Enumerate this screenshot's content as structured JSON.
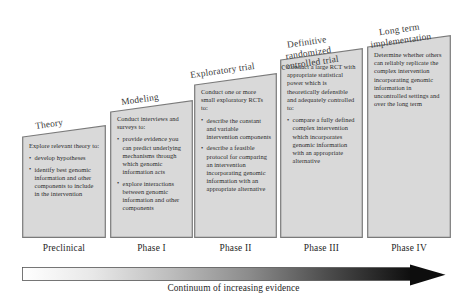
{
  "diagram": {
    "box_fill": "#d9d9d9",
    "box_stroke": "#7a7a7a",
    "arrow_start_color": "#ffffff",
    "arrow_end_color": "#0d0d0d"
  },
  "columns": [
    {
      "stage_label": "Theory",
      "phase_label": "Preclinical",
      "intro": "Explore relevant theory to:",
      "points": [
        "develop hypotheses",
        "identify best genomic information and other components to include in the intervention"
      ]
    },
    {
      "stage_label": "Modeling",
      "phase_label": "Phase I",
      "intro": "Conduct interviews and surveys to:",
      "points": [
        "provide evidence you can predict underlying mechanisms through which genomic information acts",
        "explore interactions between genomic information and other components"
      ]
    },
    {
      "stage_label": "Exploratory trial",
      "phase_label": "Phase II",
      "intro": "Conduct one or more small exploratory RCTs to:",
      "points": [
        "describe the constant and variable intervention components",
        "describe a feasible protocol for comparing an intervention incorporating genomic information with an appropriate alternative"
      ]
    },
    {
      "stage_label": "Definitive randomized controlled trial",
      "phase_label": "Phase III",
      "intro": "Conduct a large RCT with appropriate statistical power which is theoretically defensible and adequately controlled to:",
      "points": [
        "compare a fully defined complex intervention which incorporates genomic information with an appropriate alternative"
      ]
    },
    {
      "stage_label": "Long term implementation",
      "phase_label": "Phase IV",
      "intro": "Determine whether others can reliably replicate the complex intervention incorporating genomic information in uncontrolled settings and over the long term",
      "points": []
    }
  ],
  "continuum": {
    "caption": "Continuum of increasing evidence"
  }
}
